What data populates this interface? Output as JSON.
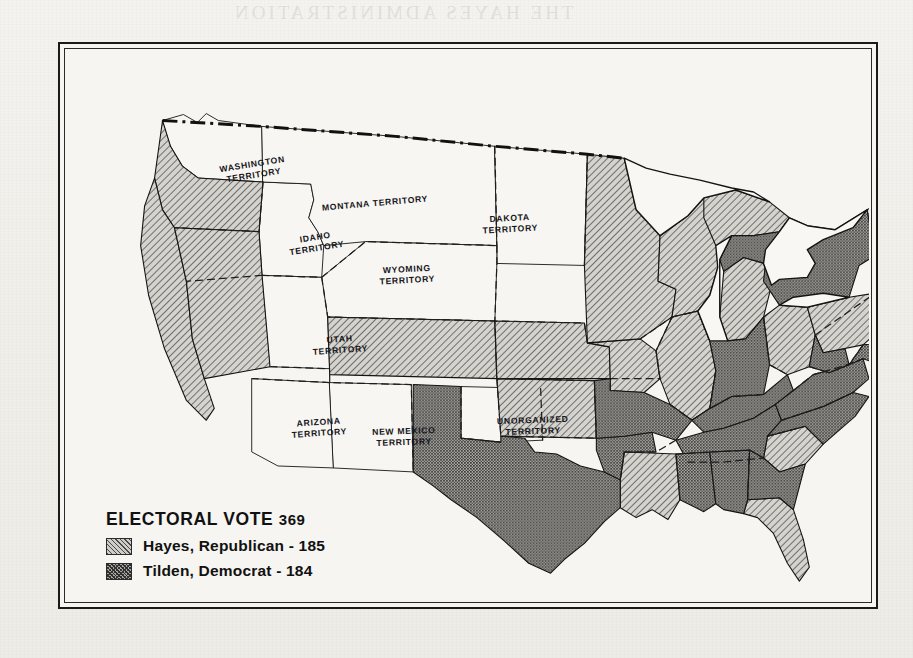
{
  "page": {
    "bleed_through_title": "THE HAYES ADMINISTRATION"
  },
  "map": {
    "legend": {
      "title_text": "ELECTORAL VOTE",
      "total_electoral_votes": "369",
      "entries": [
        {
          "swatch": "hatch-diagonal",
          "label": "Hayes, Republican - 185",
          "candidate": "Hayes",
          "party": "Republican",
          "votes": "185"
        },
        {
          "swatch": "stipple-dark",
          "label": "Tilden, Democrat - 184",
          "candidate": "Tilden",
          "party": "Democrat",
          "votes": "184"
        }
      ]
    },
    "territories": [
      {
        "id": "washington",
        "line1": "WASHINGTON",
        "line2": "TERRITORY",
        "x": 145,
        "y": 108,
        "w": 82,
        "rot": -9
      },
      {
        "id": "montana",
        "line1": "MONTANA TERRITORY",
        "line2": "",
        "x": 243,
        "y": 147,
        "w": 130,
        "rot": -5
      },
      {
        "id": "dakota",
        "line1": "DAKOTA",
        "line2": "TERRITORY",
        "x": 404,
        "y": 162,
        "w": 78,
        "rot": -3
      },
      {
        "id": "idaho",
        "line1": "IDAHO",
        "line2": "TERRITORY",
        "x": 214,
        "y": 181,
        "w": 70,
        "rot": -9
      },
      {
        "id": "wyoming",
        "line1": "WYOMING",
        "line2": "TERRITORY",
        "x": 300,
        "y": 213,
        "w": 80,
        "rot": -3
      },
      {
        "id": "utah",
        "line1": "UTAH",
        "line2": "TERRITORY",
        "x": 238,
        "y": 283,
        "w": 70,
        "rot": -4
      },
      {
        "id": "arizona",
        "line1": "ARIZONA",
        "line2": "TERRITORY",
        "x": 217,
        "y": 366,
        "w": 70,
        "rot": -4
      },
      {
        "id": "newmexico",
        "line1": "NEW MEXICO",
        "line2": "TERRITORY",
        "x": 296,
        "y": 375,
        "w": 82,
        "rot": -2
      },
      {
        "id": "unorganized",
        "line1": "UNORGANIZED",
        "line2": "TERRITORY",
        "x": 424,
        "y": 364,
        "w": 84,
        "rot": -2
      }
    ],
    "states": {
      "hayes": [
        "California",
        "Oregon",
        "Nevada",
        "Colorado",
        "Nebraska",
        "Iowa",
        "Minnesota",
        "Wisconsin",
        "Illinois",
        "Michigan",
        "Ohio",
        "Pennsylvania",
        "Vermont",
        "New Hampshire",
        "Maine",
        "Massachusetts",
        "Rhode Island",
        "Kansas",
        "Louisiana",
        "Florida",
        "South Carolina"
      ],
      "tilden": [
        "Texas",
        "Arkansas",
        "Missouri",
        "Kentucky",
        "Tennessee",
        "Mississippi",
        "Alabama",
        "Georgia",
        "North Carolina",
        "Virginia",
        "West Virginia",
        "Maryland",
        "Delaware",
        "New Jersey",
        "New York",
        "Connecticut",
        "Indiana"
      ]
    },
    "colors": {
      "paper": "#f3f1ed",
      "frame": "#1a1a1a",
      "hayes_fill": "#cfcdc7",
      "tilden_fill": "#a7a5a0",
      "ink": "#15151a"
    }
  }
}
